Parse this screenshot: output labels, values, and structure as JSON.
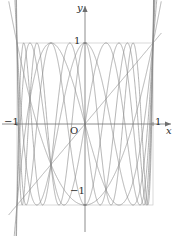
{
  "figure": {
    "title": "",
    "background_color": "#ffffff",
    "curve_color": "#8a8a8a",
    "axis_color": "#6e6e6e",
    "guide_color": "#c9c9c9",
    "text_color": "#2b2b2b"
  },
  "axes": {
    "x_axis_label": "x",
    "y_axis_label": "y",
    "origin_label": "O",
    "x_ticks": [
      {
        "value": -1,
        "label": "−1"
      },
      {
        "value": 1,
        "label": "1"
      }
    ],
    "y_ticks": [
      {
        "value": 1,
        "label": "1"
      },
      {
        "value": -1,
        "label": "−1"
      }
    ],
    "x_range": [
      -1.18,
      1.18
    ],
    "y_range": [
      -1.72,
      1.58
    ],
    "grid": false,
    "guide_box": {
      "x_min": -1,
      "x_max": 1,
      "y_min": -1,
      "y_max": 1,
      "visible": true
    }
  },
  "chart_data": {
    "type": "line",
    "title": "",
    "xlabel": "x",
    "ylabel": "y",
    "xlim": [
      -1.18,
      1.18
    ],
    "ylim": [
      -1.72,
      1.58
    ],
    "grid": false,
    "legend_position": "none",
    "function_family": "Chebyshev polynomials of the first kind T_n(x) = cos(n · arccos x)",
    "domain_plotted": [
      -1.12,
      1.12
    ],
    "series": [
      {
        "name": "T1",
        "degree": 1,
        "expression": "x",
        "extrema_count": 2,
        "roots": [
          0.0
        ]
      },
      {
        "name": "T2",
        "degree": 2,
        "expression": "2x^2 - 1",
        "extrema_count": 3,
        "roots": [
          -0.7071,
          0.7071
        ]
      },
      {
        "name": "T3",
        "degree": 3,
        "expression": "4x^3 - 3x",
        "extrema_count": 4,
        "roots": [
          -0.866,
          0.0,
          0.866
        ]
      },
      {
        "name": "T4",
        "degree": 4,
        "expression": "8x^4 - 8x^2 + 1",
        "extrema_count": 5,
        "roots": [
          -0.9239,
          -0.3827,
          0.3827,
          0.9239
        ]
      },
      {
        "name": "T5",
        "degree": 5,
        "expression": "16x^5 - 20x^3 + 5x",
        "extrema_count": 6,
        "roots": [
          -0.9511,
          -0.5878,
          0.0,
          0.5878,
          0.9511
        ]
      },
      {
        "name": "T6",
        "degree": 6,
        "expression": "32x^6 - 48x^4 + 18x^2 - 1",
        "extrema_count": 7,
        "roots": [
          -0.9659,
          -0.7071,
          -0.2588,
          0.2588,
          0.7071,
          0.9659
        ]
      },
      {
        "name": "T7",
        "degree": 7,
        "expression": "64x^7 - 112x^5 + 56x^3 - 7x",
        "extrema_count": 8,
        "roots": [
          -0.9749,
          -0.7818,
          -0.4339,
          0.0,
          0.4339,
          0.7818,
          0.9749
        ]
      },
      {
        "name": "T8",
        "degree": 8,
        "expression": "128x^8 - 256x^6 + 160x^4 - 32x^2 + 1",
        "extrema_count": 9,
        "roots": [
          -0.9808,
          -0.8315,
          -0.5556,
          -0.1951,
          0.1951,
          0.5556,
          0.8315,
          0.9808
        ]
      }
    ]
  }
}
